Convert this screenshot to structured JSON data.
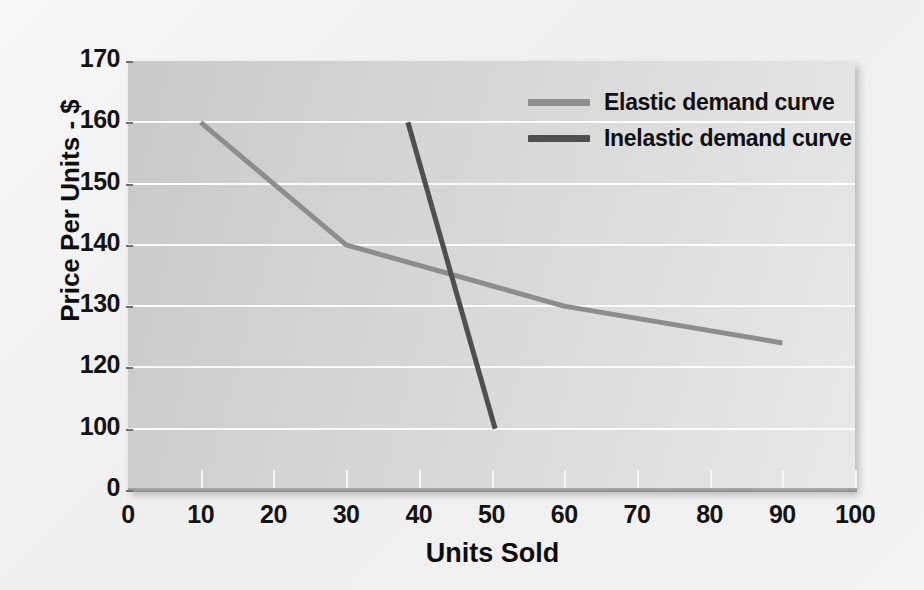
{
  "chart_data": {
    "type": "line",
    "title": "",
    "xlabel": "Units Sold",
    "ylabel": "Price Per Units - $",
    "x_ticks": [
      "0",
      "10",
      "20",
      "30",
      "40",
      "50",
      "60",
      "70",
      "80",
      "90",
      "100"
    ],
    "y_ticks": [
      "170",
      "160",
      "150",
      "140",
      "130",
      "120",
      "100",
      "0"
    ],
    "xlim": [
      0,
      100
    ],
    "y_axis_note": "non-linear category axis: evenly spaced 170,160,150,140,130,120,100,0",
    "grid": true,
    "legend_position": "top-right-inside",
    "series": [
      {
        "name": "Elastic demand curve",
        "color": "#8d8d8d",
        "points": [
          {
            "x": 10,
            "y": 160
          },
          {
            "x": 30,
            "y": 140
          },
          {
            "x": 60,
            "y": 130
          },
          {
            "x": 90,
            "y": 124
          }
        ]
      },
      {
        "name": "Inelastic demand curve",
        "color": "#4f4f4f",
        "points": [
          {
            "x": 38.5,
            "y": 160
          },
          {
            "x": 50.5,
            "y": 100
          }
        ]
      }
    ],
    "legend": [
      {
        "label": "Elastic demand curve",
        "color": "#8d8d8d"
      },
      {
        "label": "Inelastic demand curve",
        "color": "#4f4f4f"
      }
    ]
  },
  "colors": {
    "plot_background_light": "#e8e8e8",
    "plot_background_dark": "#c9c9c9",
    "figure_background": "#f2f2f2",
    "gridline": "#fbfbfb",
    "axis_line": "#9a9a9a",
    "text": "#111111"
  }
}
